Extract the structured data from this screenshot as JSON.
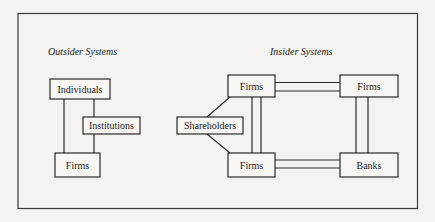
{
  "diagram": {
    "outsider": {
      "title": "Outsider Systems",
      "nodes": {
        "individuals": "Individuals",
        "institutions": "Institutions",
        "firms": "Firms"
      }
    },
    "insider": {
      "title": "Insider Systems",
      "nodes": {
        "shareholders": "Shareholders",
        "firms_top": "Firms",
        "firms_bottom": "Firms",
        "firms_right": "Firms",
        "banks": "Banks"
      }
    },
    "colors": {
      "background": "#f4f3ef",
      "stroke": "#2a2a2a"
    }
  }
}
